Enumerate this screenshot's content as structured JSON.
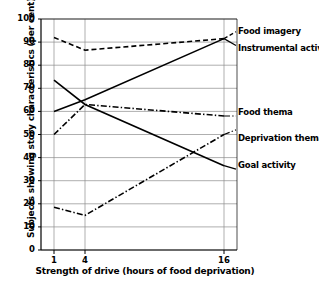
{
  "chart_data": {
    "type": "line",
    "title": "",
    "xlabel": "Strength of drive (hours of food deprivation)",
    "ylabel": "Subjects showing story characteristics (per cent)",
    "categories": [
      "1",
      "4",
      "16"
    ],
    "x_tick_labels": [
      "1",
      "4",
      "16"
    ],
    "y_tick_labels": [
      "0",
      "10",
      "20",
      "30",
      "40",
      "50",
      "60",
      "70",
      "80",
      "90",
      "100"
    ],
    "y_tick_values": [
      0,
      10,
      20,
      30,
      40,
      50,
      60,
      70,
      80,
      90,
      100
    ],
    "ylim": [
      0,
      100
    ],
    "grid": "horizontal-and-vertical",
    "legend_position": "inline-right",
    "series": [
      {
        "name": "Food imagery",
        "label": "Food imagery",
        "style": "dashed",
        "color": "#000000",
        "values": [
          92,
          86.5,
          91.5
        ]
      },
      {
        "name": "Instrumental activity",
        "label": "Instrumental activity",
        "style": "solid",
        "color": "#000000",
        "values": [
          60,
          65,
          91.5
        ]
      },
      {
        "name": "Food thema",
        "label": "Food thema",
        "style": "dash-dot",
        "color": "#000000",
        "values": [
          50,
          63,
          58
        ]
      },
      {
        "name": "Deprivation thema",
        "label": "Deprivation thema",
        "style": "dash-dot",
        "color": "#000000",
        "values": [
          18.5,
          15,
          50
        ]
      },
      {
        "name": "Goal activity",
        "label": "Goal activity",
        "style": "solid",
        "color": "#000000",
        "values": [
          73.5,
          63,
          36.5
        ]
      }
    ]
  },
  "labels": {
    "food_imagery": "Food imagery",
    "instrumental_activity": "Instrumental activity",
    "food_thema": "Food thema",
    "deprivation_thema": "Deprivation thema",
    "goal_activity": "Goal activity"
  },
  "colors": {
    "line": "#000000",
    "grid": "#8c8c8c",
    "axis": "#000000",
    "background": "#ffffff"
  }
}
